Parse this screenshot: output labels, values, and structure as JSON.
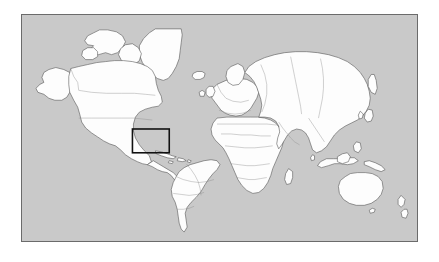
{
  "figure": {
    "type": "map",
    "title": "",
    "projection": "equirectangular",
    "frame": {
      "x": 21,
      "y": 14,
      "width": 397,
      "height": 228,
      "border_color": "#6b6b6b",
      "border_width_px": 1
    },
    "colors": {
      "page_background": "#ffffff",
      "ocean": "#c9c9c9",
      "land": "#fdfdfd",
      "coastline": "#4a4a4a",
      "country_border": "#8a8a8a",
      "highlight_box": "#111111"
    },
    "highlight_box": {
      "label": "caribbean-region-box",
      "x": 132,
      "y": 129,
      "width": 37,
      "height": 24,
      "stroke_color": "#111111",
      "stroke_width_px": 2,
      "fill": "none",
      "covers": "Caribbean Sea, Cuba, Hispaniola, Jamaica, Puerto Rico, Central America"
    },
    "extent": {
      "lon_min": -180,
      "lon_max": 180,
      "lat_min": -60,
      "lat_max": 84
    },
    "landmasses": [
      "North America",
      "Greenland",
      "South America",
      "Europe",
      "Africa",
      "Asia",
      "Australia",
      "New Zealand",
      "Iceland",
      "Madagascar",
      "Japan",
      "Indonesia",
      "Philippines",
      "British Isles",
      "Sri Lanka",
      "Cuba",
      "Hispaniola"
    ],
    "graticule": false,
    "legend": null,
    "axis_labels": null,
    "tick_labels": []
  }
}
